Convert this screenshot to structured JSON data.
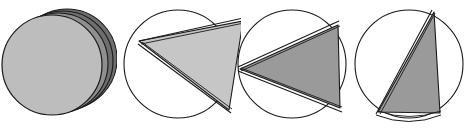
{
  "figure": {
    "title": "",
    "type": "geometric-sequence-diagram",
    "panel_count": 4,
    "background_color": "#ffffff",
    "outline_color": "#1a1a1a",
    "stroke_width": 1.1
  },
  "colors": {
    "disk_light_gray": "#bdbdbd",
    "disk_mid_gray": "#8f8f8f",
    "disk_dark_gray": "#6e6e6e",
    "wedge_light_gray": "#c6c6c6",
    "wedge_mid_gray": "#9a9a9a",
    "white_fill": "#ffffff",
    "outline": "#1a1a1a"
  },
  "panels": [
    {
      "index": 1,
      "name": "panel-stacked-disks",
      "label": "",
      "description": "Stack of flat disks seen face-on, slightly offset to the right",
      "circle": {
        "cx": 52,
        "cy": 65,
        "r": 50
      },
      "wedge_angle_deg": 0,
      "fill": "#bdbdbd",
      "back_disks": [
        {
          "dx": 6,
          "dy": -2,
          "fill": "#8f8f8f"
        },
        {
          "dx": 11,
          "dy": -4,
          "fill": "#6e6e6e"
        },
        {
          "dx": 15,
          "dy": -6,
          "fill": "#6e6e6e"
        }
      ]
    },
    {
      "index": 2,
      "name": "panel-wedge-open-wide",
      "label": "",
      "description": "Circle with a wide shaded wedge, apex at upper-left arc",
      "circle": {
        "cx": 178,
        "cy": 64,
        "r": 54
      },
      "apex": {
        "x": 139,
        "y": 41
      },
      "edge_a": {
        "x": 243,
        "y": 21
      },
      "edge_b": {
        "x": 229,
        "y": 110
      },
      "wedge_angle_deg": 74,
      "fill": "#c6c6c6"
    },
    {
      "index": 3,
      "name": "panel-wedge-open-medium",
      "label": "",
      "description": "Circle with a medium shaded wedge, apex at left of circle",
      "circle": {
        "cx": 292,
        "cy": 64,
        "r": 54
      },
      "apex": {
        "x": 240,
        "y": 69
      },
      "edge_a": {
        "x": 338,
        "y": 25
      },
      "edge_b": {
        "x": 340,
        "y": 108
      },
      "wedge_angle_deg": 50,
      "fill": "#9a9a9a"
    },
    {
      "index": 4,
      "name": "panel-wedge-nearly-closed",
      "label": "",
      "description": "Circle with a narrow shaded wedge, apex at lower-left, nearly closed",
      "circle": {
        "cx": 409,
        "cy": 64,
        "r": 54
      },
      "apex": {
        "x": 378,
        "y": 112
      },
      "edge_a": {
        "x": 434,
        "y": 12
      },
      "edge_b": {
        "x": 440,
        "y": 113
      },
      "wedge_angle_deg": 26,
      "fill": "#9a9a9a"
    }
  ]
}
